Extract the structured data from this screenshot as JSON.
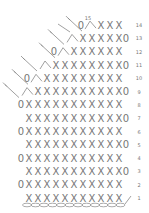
{
  "chart": {
    "row_labels": [
      "1",
      "2",
      "3",
      "4",
      "5",
      "6",
      "7",
      "8",
      "9",
      "10",
      "11",
      "12",
      "13",
      "14",
      "15"
    ],
    "rows": [
      {
        "row": 1,
        "left": "",
        "x_start": 0,
        "x_count": 11,
        "right": "slip"
      },
      {
        "row": 2,
        "left": "0",
        "x_start": 0,
        "x_count": 11,
        "right": ""
      },
      {
        "row": 3,
        "left": "",
        "x_start": 0,
        "x_count": 11,
        "right": "0"
      },
      {
        "row": 4,
        "left": "0",
        "x_start": 0,
        "x_count": 11,
        "right": ""
      },
      {
        "row": 5,
        "left": "",
        "x_start": 0,
        "x_count": 11,
        "right": "0"
      },
      {
        "row": 6,
        "left": "0",
        "x_start": 0,
        "x_count": 11,
        "right": ""
      },
      {
        "row": 7,
        "left": "",
        "x_start": 0,
        "x_count": 11,
        "right": "0"
      },
      {
        "row": 8,
        "left": "0",
        "x_start": 0,
        "x_count": 11,
        "right": ""
      },
      {
        "row": 9,
        "left": "^",
        "x_start": 1,
        "x_count": 10,
        "right": "0"
      },
      {
        "row": 10,
        "left": "0^",
        "x_start": 2,
        "x_count": 9,
        "right": ""
      },
      {
        "row": 11,
        "left": "^",
        "x_start": 3,
        "x_count": 8,
        "right": "0"
      },
      {
        "row": 12,
        "left": "0^",
        "x_start": 5,
        "x_count": 6,
        "right": ""
      },
      {
        "row": 13,
        "left": "^",
        "x_start": 6,
        "x_count": 5,
        "right": "0"
      },
      {
        "row": 14,
        "left": "0^",
        "x_start": 8,
        "x_count": 3,
        "right": ""
      }
    ],
    "foundation_chain_count": 12,
    "symbols": {
      "single_crochet": "X",
      "chain": "0",
      "decrease": "^",
      "fasten": "slip"
    }
  }
}
